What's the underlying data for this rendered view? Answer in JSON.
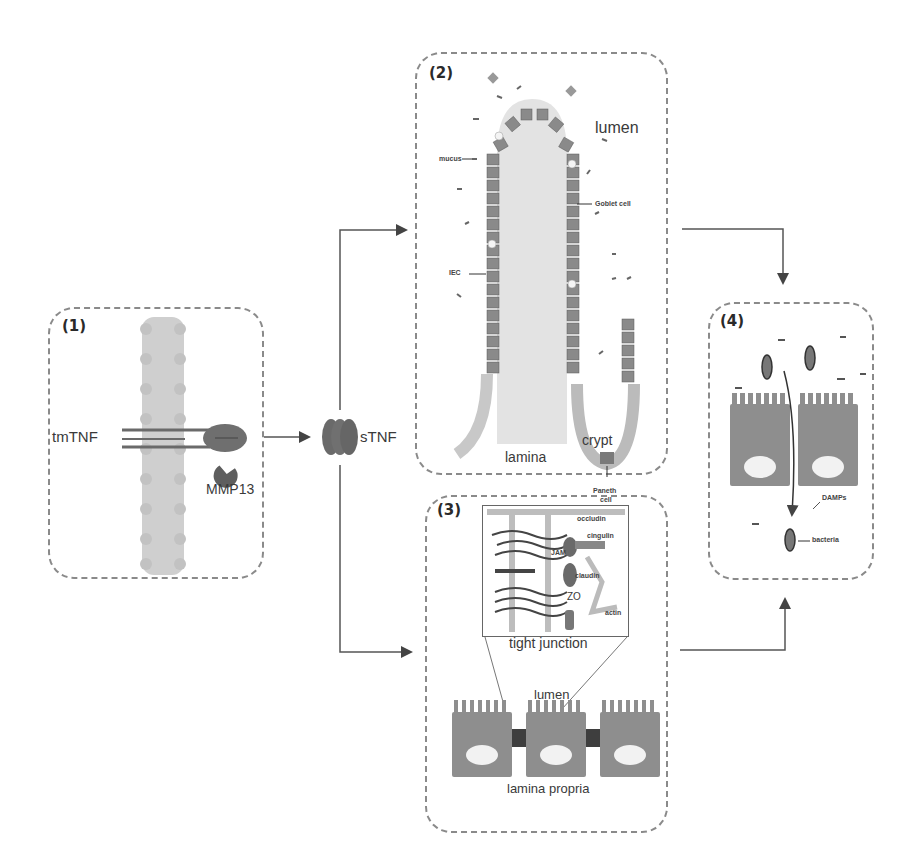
{
  "panels": {
    "p1": {
      "number": "(1)",
      "labels": {
        "tmTNF": "tmTNF",
        "MMP13": "MMP13"
      }
    },
    "soluble": {
      "label": "sTNF"
    },
    "p2": {
      "number": "(2)",
      "labels": {
        "lumen": "lumen",
        "mucus": "mucus",
        "goblet": "Goblet cell",
        "iec": "IEC",
        "lamina1": "lamina",
        "lamina2": "propria",
        "crypt": "crypt",
        "paneth1": "Paneth",
        "paneth2": "cell"
      }
    },
    "p3": {
      "number": "(3)",
      "inset": {
        "title": "tight junction",
        "labels": {
          "occludin": "occludin",
          "cingulin": "cingulin",
          "jam": "JAM",
          "claudin": "claudin",
          "zo": "ZO",
          "actin": "actin"
        }
      },
      "labels": {
        "lumen": "lumen",
        "lamina_propria": "lamina propria"
      }
    },
    "p4": {
      "number": "(4)",
      "labels": {
        "damps": "DAMPs",
        "bacteria": "bacteria"
      }
    }
  },
  "colors": {
    "dashed_border": "#8a8a8a",
    "membrane": "#c8c8c8",
    "protein": "#6e6e6e",
    "cell": "#8c8c8c",
    "nucleus": "#eeeeee",
    "arrow": "#555555"
  }
}
